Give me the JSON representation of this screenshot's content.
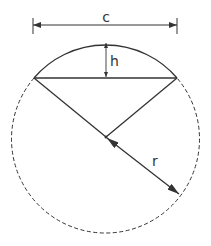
{
  "diagram": {
    "labels": {
      "chord": "c",
      "height": "h",
      "radius": "r"
    },
    "colors": {
      "stroke": "#333333",
      "background": "#ffffff"
    }
  }
}
